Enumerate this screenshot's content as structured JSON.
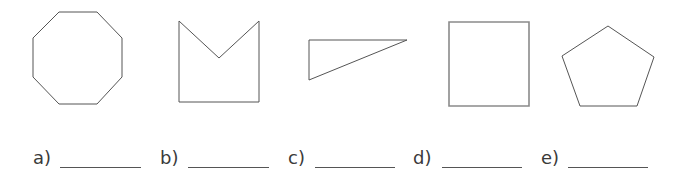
{
  "worksheet": {
    "shapes": [
      {
        "id": "a",
        "name": "octagon",
        "points": "59,12 97,12 122,38 122,77 97,104 59,104 33,77 33,38"
      },
      {
        "id": "b",
        "name": "concave-pentagon",
        "points": "179,21 219,58 259,21 259,102 179,102"
      },
      {
        "id": "c",
        "name": "right-triangle",
        "points": "309,40 407,40 309,80"
      },
      {
        "id": "d",
        "name": "square",
        "points": "449,22 529,22 529,106 449,106"
      },
      {
        "id": "e",
        "name": "pentagon",
        "points": "608,26 654,57 637,106 580,106 562,56"
      }
    ],
    "answers": [
      {
        "label": "a)",
        "label_x": 33,
        "line_x": 60,
        "line_w": 81
      },
      {
        "label": "b)",
        "label_x": 160,
        "line_x": 188,
        "line_w": 81
      },
      {
        "label": "c)",
        "label_x": 288,
        "line_x": 315,
        "line_w": 80
      },
      {
        "label": "d)",
        "label_x": 413,
        "line_x": 442,
        "line_w": 80
      },
      {
        "label": "e)",
        "label_x": 541,
        "line_x": 568,
        "line_w": 80
      }
    ],
    "colors": {
      "stroke": "#555555",
      "square_stroke": "#8a8a8a",
      "text": "#3a3a3a"
    }
  }
}
